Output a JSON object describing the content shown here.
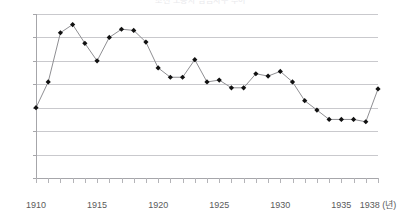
{
  "chart_data": {
    "type": "line",
    "title": "조선 노동자 임금지수 추이",
    "xlabel": "1938 (년)",
    "ylabel": "",
    "xlim": [
      1910,
      1938
    ],
    "ylim": [
      0,
      0.7
    ],
    "grid": true,
    "legend": null,
    "y_ticks": [
      "0",
      "0.1",
      "0.2",
      "0.3",
      "0.4",
      "0.5",
      "0.6",
      "0.7"
    ],
    "y_tick_values": [
      0,
      0.1,
      0.2,
      0.3,
      0.4,
      0.5,
      0.6,
      0.7
    ],
    "x_tick_labels": [
      "1910",
      "1915",
      "1920",
      "1925",
      "1930",
      "1935",
      "1938 (년)"
    ],
    "x_tick_label_years": [
      1910,
      1915,
      1920,
      1925,
      1930,
      1935,
      1938
    ],
    "x": [
      1910,
      1911,
      1912,
      1913,
      1914,
      1915,
      1916,
      1917,
      1918,
      1919,
      1920,
      1921,
      1922,
      1923,
      1924,
      1925,
      1926,
      1927,
      1928,
      1929,
      1930,
      1931,
      1932,
      1933,
      1934,
      1935,
      1936,
      1937,
      1938
    ],
    "values": [
      0.3,
      0.41,
      0.62,
      0.655,
      0.575,
      0.5,
      0.6,
      0.635,
      0.63,
      0.58,
      0.47,
      0.43,
      0.43,
      0.505,
      0.41,
      0.418,
      0.385,
      0.385,
      0.445,
      0.435,
      0.455,
      0.41,
      0.33,
      0.29,
      0.25,
      0.25,
      0.25,
      0.24,
      0.38
    ],
    "series": [
      {
        "name": "series-1",
        "marker": "diamond",
        "marker_color": "#111111",
        "line_color": "#8f8f93",
        "values": [
          0.3,
          0.41,
          0.62,
          0.655,
          0.575,
          0.5,
          0.6,
          0.635,
          0.63,
          0.58,
          0.47,
          0.43,
          0.43,
          0.505,
          0.41,
          0.418,
          0.385,
          0.385,
          0.445,
          0.435,
          0.455,
          0.41,
          0.33,
          0.29,
          0.25,
          0.25,
          0.25,
          0.24,
          0.38
        ]
      }
    ],
    "colors": {
      "line": "#8f8f93",
      "marker": "#111111",
      "grid": "#c9c9cd",
      "axis": "#a6a6aa",
      "text": "#5a5a5a",
      "background": "#ffffff"
    }
  }
}
